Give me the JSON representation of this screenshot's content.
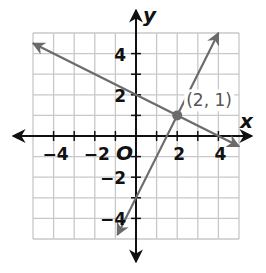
{
  "chart_data": {
    "type": "line",
    "title": "",
    "xlabel": "x",
    "ylabel": "y",
    "origin_label": "O",
    "xlim": [
      -5,
      5
    ],
    "ylim": [
      -5,
      5
    ],
    "grid": true,
    "grid_step": 1,
    "x_tick_labels": [
      "-4",
      "-2",
      "2",
      "4"
    ],
    "x_ticks": [
      -4,
      -2,
      2,
      4
    ],
    "y_tick_labels": [
      "4",
      "2",
      "-2",
      "-4"
    ],
    "y_ticks": [
      4,
      2,
      -2,
      -4
    ],
    "series": [
      {
        "name": "line-1",
        "equation": "y = -x/2 + 2",
        "slope": -0.5,
        "intercept": 2,
        "x": [
          -5,
          5
        ],
        "y": [
          4.5,
          -0.5
        ],
        "arrows": "both",
        "color": "#6b6b6b"
      },
      {
        "name": "line-2",
        "equation": "y = 2x - 3",
        "slope": 2,
        "intercept": -3,
        "x": [
          -0.9,
          4
        ],
        "y": [
          -4.8,
          5
        ],
        "arrows": "both",
        "color": "#6b6b6b"
      }
    ],
    "annotations": [
      {
        "type": "point",
        "x": 2,
        "y": 1,
        "label": "(2, 1)"
      }
    ]
  },
  "colors": {
    "grid": "#c8c8c8",
    "axis": "#111111",
    "line": "#6b6b6b",
    "background": "#ffffff"
  }
}
